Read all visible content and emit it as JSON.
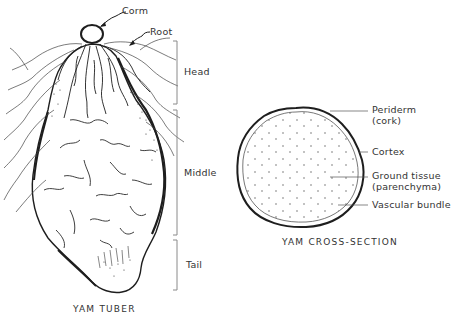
{
  "figure": {
    "tuber": {
      "title": "YAM TUBER",
      "labels": {
        "corm": "Corm",
        "root": "Root"
      },
      "regions": [
        {
          "name": "Head",
          "y_start": 41,
          "y_end": 104
        },
        {
          "name": "Middle",
          "y_start": 110,
          "y_end": 235
        },
        {
          "name": "Tail",
          "y_start": 240,
          "y_end": 290
        }
      ]
    },
    "cross_section": {
      "title": "YAM CROSS-SECTION",
      "labels": [
        {
          "line1": "Periderm",
          "line2": "(cork)"
        },
        {
          "line1": "Cortex",
          "line2": ""
        },
        {
          "line1": "Ground tissue",
          "line2": "(parenchyma)"
        },
        {
          "line1": "Vascular bundle",
          "line2": ""
        }
      ]
    }
  },
  "colors": {
    "ink": "#1e1e1e",
    "bracket": "#8a8a8a",
    "background": "#ffffff"
  }
}
